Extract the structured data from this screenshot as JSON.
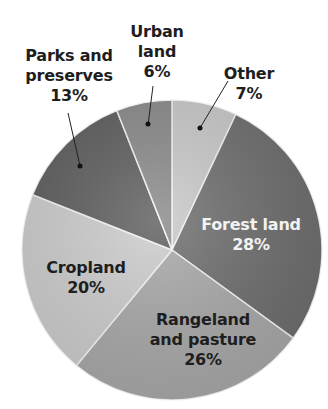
{
  "chart_data": {
    "type": "pie",
    "title": "",
    "start_angle_deg": 0,
    "direction": "clockwise",
    "slices": [
      {
        "label": "Other",
        "value": 7,
        "pct_label": "7%",
        "color": "#c9c9c9"
      },
      {
        "label": "Forest land",
        "value": 28,
        "pct_label": "28%",
        "color": "#6e6e6e"
      },
      {
        "label": "Rangeland and pasture",
        "value": 26,
        "pct_label": "26%",
        "color": "#a9a9a9"
      },
      {
        "label": "Cropland",
        "value": 20,
        "pct_label": "20%",
        "color": "#cdcdcd"
      },
      {
        "label": "Parks and preserves",
        "value": 13,
        "pct_label": "13%",
        "color": "#5e5e5e"
      },
      {
        "label": "Urban land",
        "value": 6,
        "pct_label": "6%",
        "color": "#8a8a8a"
      }
    ],
    "legend": "none (direct labels)"
  },
  "labels": {
    "other": {
      "line1": "Other",
      "line2": "7%"
    },
    "forest": {
      "line1": "Forest land",
      "line2": "28%"
    },
    "rangeland": {
      "line1": "Rangeland",
      "line2": "and pasture",
      "line3": "26%"
    },
    "cropland": {
      "line1": "Cropland",
      "line2": "20%"
    },
    "parks": {
      "line1": "Parks and",
      "line2": "preserves",
      "line3": "13%"
    },
    "urban": {
      "line1": "Urban",
      "line2": "land",
      "line3": "6%"
    }
  }
}
